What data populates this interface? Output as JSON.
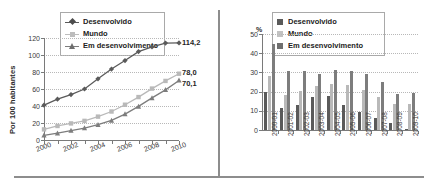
{
  "figure": {
    "divider_color": "#8d8d8d"
  },
  "series_colors": {
    "desenvolvido": "#5a5a5a",
    "mundo": "#b9b9b9",
    "em_desenvolvimento": "#7d7d7d"
  },
  "left_chart": {
    "legend": [
      {
        "label": "Desenvolvido",
        "marker": "diamond-marker"
      },
      {
        "label": "Mundo",
        "marker": "square-marker"
      },
      {
        "label": "Em desenvolvimento",
        "marker": "triangle-marker"
      }
    ],
    "ylabel": "Por 100 habitantes",
    "end_labels": {
      "desenvolvido": "114,2",
      "mundo": "78,0",
      "em_desenvolvimento": "70,1"
    }
  },
  "right_chart": {
    "legend": [
      {
        "label": "Desenvolvido",
        "swatch": "dark-swatch"
      },
      {
        "label": "Mundo",
        "swatch": "light-swatch"
      },
      {
        "label": "Em desenvolvimento",
        "swatch": "mid-swatch"
      }
    ],
    "unit": "%"
  },
  "chart_data": [
    {
      "type": "line",
      "title": "",
      "xlabel": "",
      "ylabel": "Por 100 habitantes",
      "x": [
        2000,
        2001,
        2002,
        2003,
        2004,
        2005,
        2006,
        2007,
        2008,
        2009,
        2010
      ],
      "xtick_labels": [
        "2000",
        "2002",
        "2004",
        "2006",
        "2008",
        "2010"
      ],
      "ytick_labels": [
        "0",
        "20",
        "40",
        "60",
        "80",
        "100",
        "120"
      ],
      "xlim": [
        2000,
        2010
      ],
      "ylim": [
        0,
        120
      ],
      "grid": true,
      "legend_position": "top-center",
      "series": [
        {
          "name": "Desenvolvido",
          "marker": "diamond",
          "color": "#5a5a5a",
          "values": [
            41.0,
            48.0,
            53.5,
            60.0,
            72.0,
            83.5,
            93.5,
            104.0,
            109.5,
            114.0,
            114.2
          ],
          "end_label": "114,2"
        },
        {
          "name": "Mundo",
          "marker": "square",
          "color": "#b9b9b9",
          "values": [
            12.5,
            16.5,
            19.5,
            22.5,
            27.5,
            33.5,
            41.5,
            50.5,
            60.5,
            69.5,
            78.0
          ],
          "end_label": "78,0"
        },
        {
          "name": "Em desenvolvimento",
          "marker": "triangle",
          "color": "#7d7d7d",
          "values": [
            5.5,
            8.0,
            11.0,
            14.0,
            18.0,
            23.0,
            30.5,
            39.5,
            49.5,
            59.0,
            70.1
          ],
          "end_label": "70,1"
        }
      ]
    },
    {
      "type": "bar",
      "title": "",
      "xlabel": "",
      "ylabel": "%",
      "categories": [
        "2000-01",
        "2001-02",
        "2002-03",
        "2003-04",
        "2004-05",
        "2005-06",
        "2006-07",
        "2007-08",
        "2008-09",
        "2009-10"
      ],
      "ytick_labels": [
        "0",
        "10",
        "20",
        "30",
        "40",
        "50"
      ],
      "ylim": [
        0,
        50
      ],
      "grid": true,
      "legend_position": "top-center",
      "series": [
        {
          "name": "Desenvolvido",
          "color": "#5a5a5a",
          "values": [
            20.0,
            11.3,
            13.2,
            17.0,
            17.5,
            13.2,
            9.6,
            6.3,
            3.8,
            0.5
          ]
        },
        {
          "name": "Mundo",
          "color": "#b9b9b9",
          "values": [
            28.0,
            18.3,
            20.5,
            22.8,
            23.8,
            23.2,
            20.7,
            17.3,
            13.8,
            13.6
          ]
        },
        {
          "name": "Em desenvolvimento",
          "color": "#7d7d7d",
          "values": [
            44.8,
            30.6,
            30.6,
            29.3,
            31.5,
            30.6,
            29.2,
            25.2,
            18.8,
            19.5
          ]
        }
      ]
    }
  ]
}
